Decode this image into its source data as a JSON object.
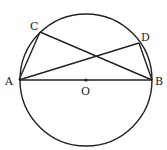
{
  "diagram": {
    "type": "circle-geometry",
    "circle": {
      "center_label": "O",
      "cx": 86,
      "cy": 80,
      "r": 66
    },
    "points": {
      "A": {
        "label": "A",
        "x": 19,
        "y": 80,
        "lx": 5,
        "ly": 85
      },
      "B": {
        "label": "B",
        "x": 152,
        "y": 80,
        "lx": 155,
        "ly": 85
      },
      "C": {
        "label": "C",
        "x": 40,
        "y": 32,
        "lx": 30,
        "ly": 30
      },
      "D": {
        "label": "D",
        "x": 139,
        "y": 43,
        "lx": 141,
        "ly": 41
      },
      "O": {
        "label": "O",
        "x": 86,
        "y": 80,
        "lx": 81,
        "ly": 94
      }
    },
    "segments": [
      [
        "A",
        "B"
      ],
      [
        "A",
        "C"
      ],
      [
        "C",
        "B"
      ],
      [
        "A",
        "D"
      ],
      [
        "D",
        "B"
      ]
    ],
    "colors": {
      "stroke": "#222222",
      "background": "#ffffff"
    }
  }
}
